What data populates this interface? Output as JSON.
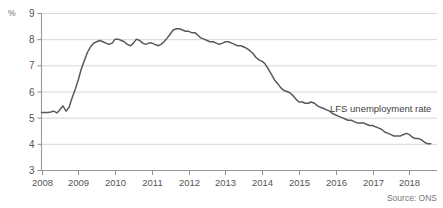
{
  "chart_data": {
    "type": "line",
    "title": "",
    "subtitle": "",
    "xlabel": "",
    "ylabel": "%",
    "unit_label": "%",
    "source": "Source: ONS",
    "grid": true,
    "legend_position": "inline-right",
    "xlim": [
      2008,
      2018.75
    ],
    "ylim": [
      3,
      9
    ],
    "yticks": [
      3,
      4,
      5,
      6,
      7,
      8,
      9
    ],
    "ytick_labels": [
      "3",
      "4",
      "5",
      "6",
      "7",
      "8",
      "9"
    ],
    "xticks": [
      2008,
      2009,
      2010,
      2011,
      2012,
      2013,
      2014,
      2015,
      2016,
      2017,
      2018
    ],
    "xtick_labels": [
      "2008",
      "2009",
      "2010",
      "2011",
      "2012",
      "2013",
      "2014",
      "2015",
      "2016",
      "2017",
      "2018"
    ],
    "line_color": "#58595b",
    "grid_color": "#d7d7d7",
    "series": [
      {
        "name": "LFS unemployment rate",
        "label_text": "LFS unemployment rate",
        "x": [
          2008.0,
          2008.08,
          2008.17,
          2008.25,
          2008.33,
          2008.42,
          2008.5,
          2008.58,
          2008.67,
          2008.75,
          2008.83,
          2008.92,
          2009.0,
          2009.08,
          2009.17,
          2009.25,
          2009.33,
          2009.42,
          2009.5,
          2009.58,
          2009.67,
          2009.75,
          2009.83,
          2009.92,
          2010.0,
          2010.08,
          2010.17,
          2010.25,
          2010.33,
          2010.42,
          2010.5,
          2010.58,
          2010.67,
          2010.75,
          2010.83,
          2010.92,
          2011.0,
          2011.08,
          2011.17,
          2011.25,
          2011.33,
          2011.42,
          2011.5,
          2011.58,
          2011.67,
          2011.75,
          2011.83,
          2011.92,
          2012.0,
          2012.08,
          2012.17,
          2012.25,
          2012.33,
          2012.42,
          2012.5,
          2012.58,
          2012.67,
          2012.75,
          2012.83,
          2012.92,
          2013.0,
          2013.08,
          2013.17,
          2013.25,
          2013.33,
          2013.42,
          2013.5,
          2013.58,
          2013.67,
          2013.75,
          2013.83,
          2013.92,
          2014.0,
          2014.08,
          2014.17,
          2014.25,
          2014.33,
          2014.42,
          2014.5,
          2014.58,
          2014.67,
          2014.75,
          2014.83,
          2014.92,
          2015.0,
          2015.08,
          2015.17,
          2015.25,
          2015.33,
          2015.42,
          2015.5,
          2015.58,
          2015.67,
          2015.75,
          2015.83,
          2015.92,
          2016.0,
          2016.08,
          2016.17,
          2016.25,
          2016.33,
          2016.42,
          2016.5,
          2016.58,
          2016.67,
          2016.75,
          2016.83,
          2016.92,
          2017.0,
          2017.08,
          2017.17,
          2017.25,
          2017.33,
          2017.42,
          2017.5,
          2017.58,
          2017.67,
          2017.75,
          2017.83,
          2017.92,
          2018.0,
          2018.08,
          2018.17,
          2018.25,
          2018.33,
          2018.42,
          2018.5,
          2018.58
        ],
        "values": [
          5.2,
          5.2,
          5.2,
          5.22,
          5.25,
          5.18,
          5.3,
          5.45,
          5.25,
          5.4,
          5.75,
          6.1,
          6.45,
          6.85,
          7.2,
          7.5,
          7.7,
          7.85,
          7.9,
          7.95,
          7.9,
          7.85,
          7.8,
          7.85,
          8.0,
          8.0,
          7.95,
          7.9,
          7.8,
          7.75,
          7.85,
          8.0,
          7.95,
          7.85,
          7.8,
          7.85,
          7.85,
          7.8,
          7.75,
          7.8,
          7.9,
          8.05,
          8.2,
          8.35,
          8.4,
          8.4,
          8.35,
          8.3,
          8.3,
          8.25,
          8.25,
          8.15,
          8.05,
          8.0,
          7.95,
          7.9,
          7.9,
          7.85,
          7.8,
          7.85,
          7.9,
          7.9,
          7.85,
          7.8,
          7.75,
          7.75,
          7.7,
          7.65,
          7.55,
          7.45,
          7.3,
          7.2,
          7.15,
          7.05,
          6.85,
          6.65,
          6.45,
          6.3,
          6.15,
          6.05,
          6.0,
          5.95,
          5.85,
          5.7,
          5.6,
          5.6,
          5.55,
          5.55,
          5.6,
          5.55,
          5.45,
          5.4,
          5.35,
          5.3,
          5.25,
          5.15,
          5.1,
          5.05,
          5.0,
          4.95,
          4.9,
          4.9,
          4.85,
          4.8,
          4.8,
          4.8,
          4.75,
          4.7,
          4.7,
          4.65,
          4.6,
          4.55,
          4.45,
          4.4,
          4.35,
          4.3,
          4.3,
          4.3,
          4.35,
          4.4,
          4.35,
          4.25,
          4.2,
          4.2,
          4.15,
          4.05,
          4.0,
          4.0
        ]
      }
    ]
  }
}
